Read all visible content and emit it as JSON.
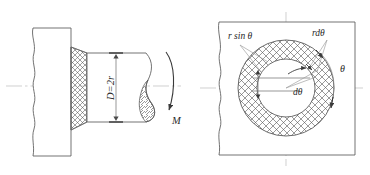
{
  "figure": {
    "background": "#ffffff",
    "line_color": "#4a4a4a",
    "centerline_color": "#b9b9b9",
    "hatch_color": "#555555",
    "width": 370,
    "height": 175
  },
  "left_view": {
    "name": "side-section-view",
    "labels": {
      "diameter": "D=2r",
      "torque": "M"
    },
    "parts": {
      "block": "flange-block",
      "shaft": "shaft",
      "friction_ring": "cross-hatched-annular-contact-face",
      "break": "conventional-break-with-hatched-lens"
    }
  },
  "right_view": {
    "name": "front-view",
    "labels": {
      "chord": "r sin θ",
      "arc_element": "rdθ",
      "angle_element": "dθ",
      "angle": "θ"
    },
    "parts": {
      "frame": "broken-out-frame",
      "annulus": "cross-hatched-annular-ring",
      "inner_circle": "inner-bore-circle",
      "centerlines": "horizontal-and-vertical-centerlines"
    }
  }
}
